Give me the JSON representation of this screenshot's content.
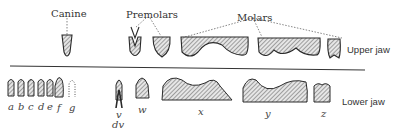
{
  "diagram": {
    "group_labels": {
      "canine": "Canine",
      "premolars": "Premolars",
      "molars": "Molars"
    },
    "jaw_labels": {
      "upper": "Upper jaw",
      "lower": "Lower jaw"
    },
    "lower_tooth_letters": {
      "a": "a",
      "b": "b",
      "c": "c",
      "d": "d",
      "e": "e",
      "f": "f",
      "g": "g",
      "v": "v",
      "dv": "dv",
      "w": "w",
      "x": "x",
      "y": "y",
      "z": "z"
    },
    "colors": {
      "outline": "#2a2a2a",
      "hatch": "#555555",
      "divider": "#333333",
      "leader": "#666666"
    }
  }
}
